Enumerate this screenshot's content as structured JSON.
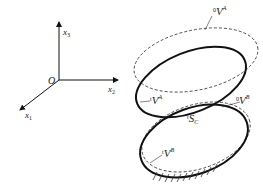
{
  "diagram": {
    "axes": {
      "origin_label": "O",
      "x1_label": "x",
      "x1_sub": "1",
      "x2_label": "x",
      "x2_sub": "2",
      "x3_label": "x",
      "x3_sub": "3"
    },
    "labels": {
      "upper_dashed": {
        "pre": "0",
        "main": "V",
        "sup": "A"
      },
      "upper_solid": {
        "pre": "t",
        "main": "V",
        "sup": "A"
      },
      "lower_dashed": {
        "pre": "0",
        "main": "V",
        "sup": "B"
      },
      "contact_surface": {
        "pre": "t",
        "main": "S",
        "sub": "C"
      },
      "lower_solid": {
        "pre": "t",
        "main": "V",
        "sup": "B"
      }
    },
    "colors": {
      "stroke": "#111111",
      "dashed": "#333333",
      "background": "#ffffff"
    }
  }
}
